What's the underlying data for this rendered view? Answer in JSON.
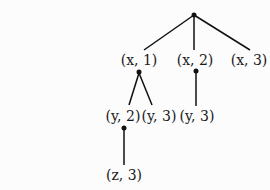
{
  "diagram": {
    "type": "tree",
    "root": {
      "label": ""
    },
    "nodes": [
      {
        "id": "x1",
        "label": "(x, 1)",
        "parent": "root"
      },
      {
        "id": "x2",
        "label": "(x, 2)",
        "parent": "root"
      },
      {
        "id": "x3",
        "label": "(x, 3)",
        "parent": "root"
      },
      {
        "id": "y2",
        "label": "(y, 2)",
        "parent": "x1"
      },
      {
        "id": "y3a",
        "label": "(y, 3)",
        "parent": "x1"
      },
      {
        "id": "y3b",
        "label": "(y, 3)",
        "parent": "x2"
      },
      {
        "id": "z3",
        "label": "(z, 3)",
        "parent": "y2"
      }
    ]
  }
}
